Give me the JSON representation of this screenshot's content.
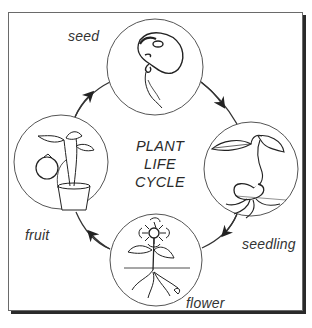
{
  "diagram": {
    "title_lines": [
      "PLANT",
      "LIFE",
      "CYCLE"
    ],
    "stages": [
      {
        "id": "seed",
        "label": "seed",
        "illustration": "bean-seed-sprouting-icon"
      },
      {
        "id": "seedling",
        "label": "seedling",
        "illustration": "seedling-with-leaves-icon"
      },
      {
        "id": "flower",
        "label": "flower",
        "illustration": "sunflower-with-roots-icon"
      },
      {
        "id": "fruit",
        "label": "fruit",
        "illustration": "potted-tomato-plant-icon"
      }
    ],
    "cycle_direction": "clockwise",
    "colors": {
      "line": "#333333",
      "border": "#6a6a6a",
      "shadow": "#2a2a2a",
      "text": "#333333"
    }
  }
}
